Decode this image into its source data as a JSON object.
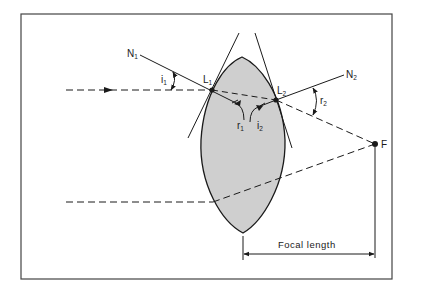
{
  "diagram": {
    "colors": {
      "frame": "#444444",
      "line": "#1a1a1a",
      "lens_fill": "#cfcfcf",
      "background": "#ffffff"
    },
    "labels": {
      "N1": {
        "main": "N",
        "sub": "1"
      },
      "N2": {
        "main": "N",
        "sub": "2"
      },
      "L1": {
        "main": "L",
        "sub": "1"
      },
      "L2": {
        "main": "L",
        "sub": "2"
      },
      "i1": {
        "main": "i",
        "sub": "1"
      },
      "i2": {
        "main": "i",
        "sub": "2"
      },
      "r1": {
        "main": "r",
        "sub": "1"
      },
      "r2": {
        "main": "r",
        "sub": "2"
      },
      "F": "F"
    },
    "focal_length_label": "Focal length",
    "points": {
      "L1": [
        212,
        90
      ],
      "L2": [
        276,
        100
      ],
      "F": [
        375,
        144
      ]
    }
  }
}
